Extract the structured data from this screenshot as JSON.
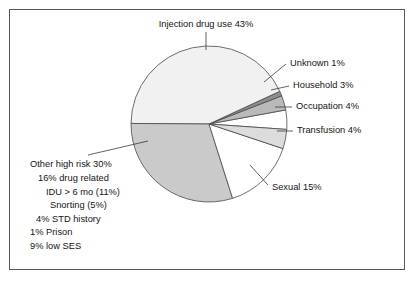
{
  "figure": {
    "border_color": "#585858",
    "background": "#ffffff"
  },
  "chart_data": {
    "type": "pie",
    "title": "",
    "xlabel": "",
    "ylabel": "",
    "legend_position": "none",
    "grid": false,
    "total_percent": 100,
    "start_angle_deg": -4,
    "direction": "counterclockwise",
    "center": {
      "x": 209,
      "y": 124
    },
    "radius": 78,
    "categories": [
      "Occupation",
      "Household",
      "Unknown",
      "Injection drug use",
      "Other high risk",
      "Sexual",
      "Transfusion"
    ],
    "values": [
      4,
      3,
      1,
      43,
      30,
      15,
      4
    ],
    "colors": [
      "#ffffff",
      "#b9b9b9",
      "#8d8d8d",
      "#f1f1f1",
      "#cacaca",
      "#ffffff",
      "#dcdcdc"
    ],
    "data_labels": [
      "Occupation 4%",
      "Household 3%",
      "Unknown 1%",
      "Injection drug use 43%",
      "Other high risk 30%",
      "Sexual 15%",
      "Transfusion 4%"
    ]
  },
  "labels": {
    "injection": {
      "text": "Injection drug use 43%",
      "x": 206,
      "y": 25,
      "anchor": "middle",
      "leader": {
        "x1": 206,
        "y1": 32,
        "x2": 206,
        "y2": 50
      }
    },
    "unknown": {
      "text": "Unknown 1%",
      "x": 290,
      "y": 64,
      "anchor": "start",
      "leader": {
        "x1": 286,
        "y1": 64,
        "x2": 264,
        "y2": 82
      }
    },
    "household": {
      "text": "Household 3%",
      "x": 293,
      "y": 86,
      "anchor": "start",
      "leader": {
        "x1": 289,
        "y1": 86,
        "x2": 271,
        "y2": 90
      }
    },
    "occupation": {
      "text": "Occupation 4%",
      "x": 296,
      "y": 107,
      "anchor": "start",
      "leader": {
        "x1": 292,
        "y1": 107,
        "x2": 275,
        "y2": 107
      }
    },
    "transfusion": {
      "text": "Transfusion 4%",
      "x": 297,
      "y": 131,
      "anchor": "start",
      "leader": {
        "x1": 293,
        "y1": 131,
        "x2": 277,
        "y2": 131
      }
    },
    "sexual": {
      "text": "Sexual 15%",
      "x": 272,
      "y": 188,
      "anchor": "start",
      "leader": {
        "x1": 268,
        "y1": 185,
        "x2": 250,
        "y2": 165
      }
    },
    "other_high_risk": {
      "leader": {
        "x1": 88,
        "y1": 155,
        "x2": 148,
        "y2": 141
      },
      "lines": [
        {
          "text": "Other high risk 30%",
          "x": 30,
          "y": 167
        },
        {
          "text": "16% drug related",
          "x": 38,
          "y": 181
        },
        {
          "text": "IDU > 6 mo (11%)",
          "x": 46,
          "y": 195
        },
        {
          "text": "Snorting (5%)",
          "x": 50,
          "y": 208
        },
        {
          "text": "4% STD history",
          "x": 36,
          "y": 222
        },
        {
          "text": "1% Prison",
          "x": 30,
          "y": 235
        },
        {
          "text": "9% low SES",
          "x": 30,
          "y": 249
        }
      ]
    }
  }
}
